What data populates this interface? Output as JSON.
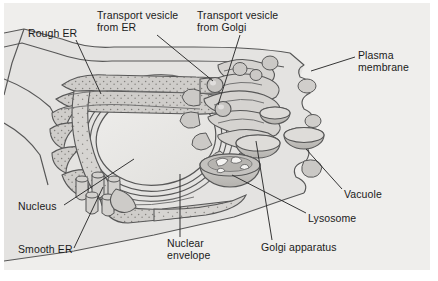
{
  "figure": {
    "background_color": "#ececeb",
    "page_color": "#ffffff",
    "ink_color": "#1a1a1a"
  },
  "palette": {
    "panel_bg": "#ececeb",
    "cytoplasm": "#e4e3e1",
    "outside_cell": "#efeeec",
    "membrane_line": "#575757",
    "organelle_fill": "#cfcdca",
    "organelle_fill_light": "#dddbd8",
    "organelle_fill_dark": "#b9b7b3",
    "nucleus_fill": "#e9e8e6",
    "stipple": "#8e8c88",
    "leader_line": "#2b2b2b",
    "text": "#1a1a1a"
  },
  "labels": [
    {
      "id": "rough-er",
      "lines": [
        "Rough ER"
      ],
      "x": 28,
      "y": 28,
      "leader": {
        "x1": 76,
        "y1": 41,
        "x2": 101,
        "y2": 95
      }
    },
    {
      "id": "transport-vesicle-from-er",
      "lines": [
        "Transport vesicle",
        "from ER"
      ],
      "x": 97,
      "y": 10,
      "leader": {
        "x1": 157,
        "y1": 36,
        "x2": 213,
        "y2": 82
      }
    },
    {
      "id": "transport-vesicle-from-golgi",
      "lines": [
        "Transport vesicle",
        "from Golgi"
      ],
      "x": 197,
      "y": 10,
      "leader": {
        "x1": 240,
        "y1": 36,
        "x2": 218,
        "y2": 106
      }
    },
    {
      "id": "plasma-membrane",
      "lines": [
        "Plasma",
        "membrane"
      ],
      "x": 358,
      "y": 51,
      "leader": {
        "x1": 355,
        "y1": 58,
        "x2": 311,
        "y2": 72
      }
    },
    {
      "id": "vacuole",
      "lines": [
        "Vacuole"
      ],
      "x": 344,
      "y": 191,
      "leader": {
        "x1": 342,
        "y1": 190,
        "x2": 306,
        "y2": 150
      }
    },
    {
      "id": "lysosome",
      "lines": [
        "Lysosome"
      ],
      "x": 308,
      "y": 215,
      "leader": {
        "x1": 306,
        "y1": 214,
        "x2": 272,
        "y2": 176
      }
    },
    {
      "id": "golgi-apparatus",
      "lines": [
        "Golgi apparatus"
      ],
      "x": 261,
      "y": 244,
      "leader": {
        "x1": 272,
        "y1": 241,
        "x2": 256,
        "y2": 142
      }
    },
    {
      "id": "nuclear-envelope",
      "lines": [
        "Nuclear",
        "envelope"
      ],
      "x": 167,
      "y": 240,
      "leader": {
        "x1": 180,
        "y1": 238,
        "x2": 180,
        "y2": 175
      }
    },
    {
      "id": "smooth-er",
      "lines": [
        "Smooth ER"
      ],
      "x": 18,
      "y": 245,
      "leader": {
        "x1": 74,
        "y1": 249,
        "x2": 103,
        "y2": 188
      }
    },
    {
      "id": "nucleus",
      "lines": [
        "Nucleus"
      ],
      "x": 18,
      "y": 202,
      "leader": {
        "x1": 64,
        "y1": 206,
        "x2": 134,
        "y2": 160
      }
    }
  ],
  "organelles": [
    {
      "id": "nucleus",
      "name": "Nucleus"
    },
    {
      "id": "nuclear-envelope",
      "name": "Nuclear envelope"
    },
    {
      "id": "rough-er",
      "name": "Rough ER"
    },
    {
      "id": "smooth-er",
      "name": "Smooth ER"
    },
    {
      "id": "golgi-apparatus",
      "name": "Golgi apparatus"
    },
    {
      "id": "lysosome",
      "name": "Lysosome"
    },
    {
      "id": "vacuole",
      "name": "Vacuole"
    },
    {
      "id": "plasma-membrane",
      "name": "Plasma membrane"
    },
    {
      "id": "transport-vesicle-from-er",
      "name": "Transport vesicle from ER"
    },
    {
      "id": "transport-vesicle-from-golgi",
      "name": "Transport vesicle from Golgi"
    }
  ]
}
